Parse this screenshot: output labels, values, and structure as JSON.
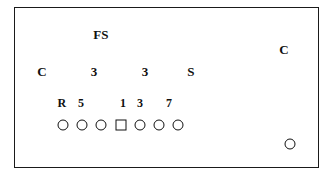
{
  "diagram": {
    "frame": {
      "border_color": "#1a1a1a"
    },
    "ink_color": "#101010",
    "labels": [
      {
        "id": "free-safety",
        "text": "FS",
        "x": 100,
        "y": 33,
        "size": "normal"
      },
      {
        "id": "corner-left",
        "text": "C",
        "x": 41,
        "y": 70,
        "size": "normal"
      },
      {
        "id": "technique-3-left",
        "text": "3",
        "x": 93,
        "y": 70,
        "size": "normal"
      },
      {
        "id": "technique-3-right",
        "text": "3",
        "x": 144,
        "y": 70,
        "size": "normal"
      },
      {
        "id": "strong-safety",
        "text": "S",
        "x": 190,
        "y": 70,
        "size": "normal"
      },
      {
        "id": "corner-right",
        "text": "C",
        "x": 283,
        "y": 48,
        "size": "normal"
      },
      {
        "id": "gap-R",
        "text": "R",
        "x": 61,
        "y": 102,
        "size": "small"
      },
      {
        "id": "gap-5",
        "text": "5",
        "x": 80,
        "y": 102,
        "size": "small"
      },
      {
        "id": "gap-1",
        "text": "1",
        "x": 122,
        "y": 102,
        "size": "small"
      },
      {
        "id": "gap-3",
        "text": "3",
        "x": 139,
        "y": 102,
        "size": "small"
      },
      {
        "id": "gap-7",
        "text": "7",
        "x": 168,
        "y": 102,
        "size": "small"
      }
    ],
    "line_players": [
      {
        "id": "lineman-1",
        "shape": "circle",
        "x": 62,
        "y": 124
      },
      {
        "id": "lineman-2",
        "shape": "circle",
        "x": 81,
        "y": 124
      },
      {
        "id": "lineman-3",
        "shape": "circle",
        "x": 100,
        "y": 124
      },
      {
        "id": "center",
        "shape": "square",
        "x": 120,
        "y": 124
      },
      {
        "id": "lineman-4",
        "shape": "circle",
        "x": 139,
        "y": 124
      },
      {
        "id": "lineman-5",
        "shape": "circle",
        "x": 158,
        "y": 124
      },
      {
        "id": "lineman-6",
        "shape": "circle",
        "x": 177,
        "y": 124
      },
      {
        "id": "split-receiver",
        "shape": "circle",
        "x": 289,
        "y": 143
      }
    ]
  }
}
